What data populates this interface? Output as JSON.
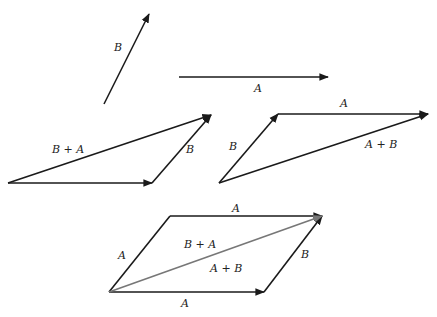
{
  "diagram": {
    "colors": {
      "vector": "#1a1a1a",
      "diagonal": "#777777",
      "background": "#ffffff"
    },
    "standalone": {
      "B": {
        "label": "B",
        "from": [
          104,
          104
        ],
        "to": [
          149,
          14
        ]
      },
      "A": {
        "label": "A",
        "from": [
          179,
          77
        ],
        "to": [
          328,
          77
        ]
      }
    },
    "triangle_left": {
      "A_label": "",
      "B_label": "B",
      "sum_label": "B + A"
    },
    "triangle_right": {
      "A_label": "A",
      "B_label": "B",
      "sum_label": "A + B"
    },
    "parallelogram": {
      "top_label": "A",
      "left_label": "A",
      "right_label": "B",
      "bottom_label": "A",
      "diag_upper_label": "B + A",
      "diag_lower_label": "A + B"
    }
  }
}
